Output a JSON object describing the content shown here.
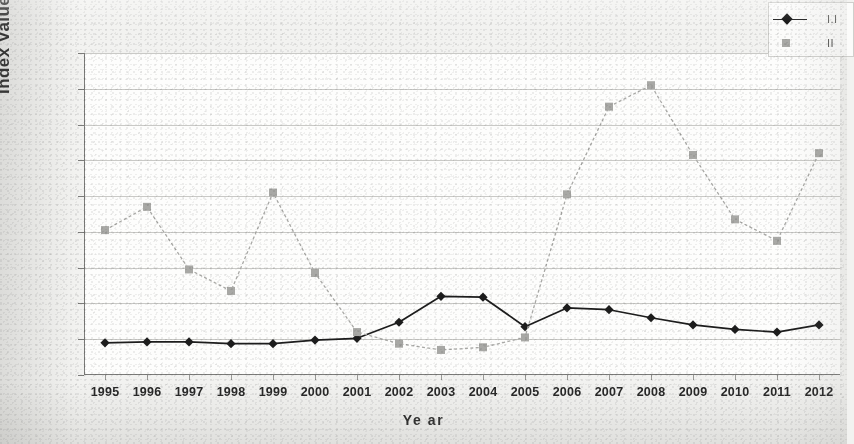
{
  "chart_data": {
    "type": "line",
    "title": "",
    "xlabel": "Ye ar",
    "ylabel": "Index Values",
    "categories": [
      "1995",
      "1996",
      "1997",
      "1998",
      "1999",
      "2000",
      "2001",
      "2002",
      "2003",
      "2004",
      "2005",
      "2006",
      "2007",
      "2008",
      "2009",
      "2010",
      "2011",
      "2012"
    ],
    "ylim": [
      0,
      18
    ],
    "ytick_labels": [
      "18.000",
      "16.000",
      "14.000",
      "12.000",
      "10.000",
      "8.000",
      "6.000",
      "4.000",
      "2.000",
      "0.000"
    ],
    "ytick_values": [
      18,
      16,
      14,
      12,
      10,
      8,
      6,
      4,
      2,
      0
    ],
    "grid": true,
    "legend_position": "top-right",
    "series": [
      {
        "name": "I.I",
        "marker": "diamond",
        "color": "#1d1d1d",
        "values": [
          1.8,
          1.85,
          1.85,
          1.75,
          1.75,
          1.95,
          2.05,
          2.95,
          4.4,
          4.35,
          2.7,
          3.75,
          3.65,
          3.2,
          2.8,
          2.55,
          2.4,
          2.8
        ]
      },
      {
        "name": "II",
        "marker": "square",
        "color": "#a8a8a5",
        "values": [
          8.1,
          9.4,
          5.9,
          4.7,
          10.2,
          5.7,
          2.4,
          1.75,
          1.4,
          1.55,
          2.1,
          10.1,
          15.0,
          16.2,
          12.3,
          8.7,
          7.5,
          12.4
        ]
      }
    ]
  },
  "legend": {
    "entries": [
      {
        "label": "I.I",
        "marker": "diamond"
      },
      {
        "label": "II",
        "marker": "square"
      }
    ]
  },
  "axes": {
    "y_title": "Index Values",
    "x_title": "Ye ar"
  }
}
